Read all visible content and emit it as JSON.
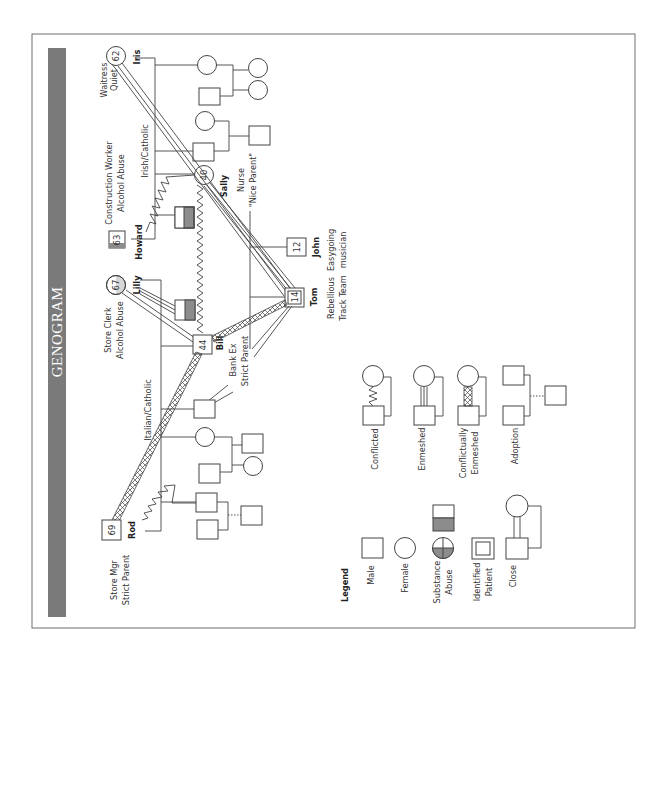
{
  "title": "GENOGRAM",
  "colors": {
    "title_bar": "#7a7a7a",
    "frame": "#6e6e6e",
    "line": "#444444",
    "substance_fill": "#8c8c8c"
  },
  "people": {
    "iris": {
      "name": "Iris",
      "age": "62",
      "sex": "female",
      "notes": [
        "Waitress",
        "Quiet"
      ]
    },
    "howard": {
      "name": "Howard",
      "age": "63",
      "sex": "male",
      "notes": [
        "Construction Worker",
        "Alcohol Abuse"
      ]
    },
    "sally": {
      "name": "Sally",
      "age": "40",
      "sex": "female",
      "notes": [
        "Nurse",
        "\"Nice Parent\""
      ]
    },
    "lilly": {
      "name": "Lilly",
      "age": "67",
      "sex": "female",
      "notes": [
        "Store Clerk",
        "Alcohol Abuse"
      ]
    },
    "rod": {
      "name": "Rod",
      "age": "69",
      "sex": "male",
      "notes": [
        "Store Mgr",
        "Strict Parent"
      ]
    },
    "bill": {
      "name": "Bill",
      "age": "44",
      "sex": "male",
      "notes": [
        "Bank Ex",
        "Strict Parent"
      ]
    },
    "tom": {
      "name": "Tom",
      "age": "14",
      "sex": "male",
      "identified_patient": true,
      "notes": [
        "Rebellious",
        "Track Team"
      ]
    },
    "john": {
      "name": "John",
      "age": "12",
      "sex": "male",
      "notes": [
        "Easygoing",
        "musician"
      ]
    }
  },
  "family_labels": {
    "maternal": "Irish/Catholic",
    "paternal": "Italian/Catholic"
  },
  "legend": {
    "heading": "Legend",
    "items": [
      {
        "label": "Male",
        "icon": "male-square"
      },
      {
        "label": "Female",
        "icon": "female-circle"
      },
      {
        "label_line1": "Substance",
        "label_line2": "Abuse",
        "icon": "substance-abuse-half-fill"
      },
      {
        "label_line1": "Identified",
        "label_line2": "Patient",
        "icon": "identified-patient-double-square"
      },
      {
        "label": "Close",
        "icon": "close-relationship"
      }
    ],
    "relationships": [
      {
        "label": "Conflicted",
        "icon": "zigzag-line"
      },
      {
        "label": "Enmeshed",
        "icon": "triple-line"
      },
      {
        "label_line1": "Conflictually",
        "label_line2": "Enmeshed",
        "icon": "hatched-band"
      },
      {
        "label": "Adoption",
        "icon": "dotted-adoption-line"
      }
    ]
  }
}
